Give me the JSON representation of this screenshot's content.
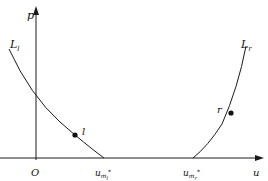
{
  "diagram": {
    "type": "p-u phase plane",
    "axes": {
      "x_label": "u",
      "y_label": "p",
      "origin_label": "O"
    },
    "curves": [
      {
        "id": "Ll",
        "label": "L",
        "label_sub": "l",
        "point_label": "l"
      },
      {
        "id": "Lr",
        "label": "L",
        "label_sub": "r",
        "point_label": "r"
      }
    ],
    "x_ticks": [
      {
        "label": "u",
        "sub": "m",
        "subsub": "l",
        "sup": "*"
      },
      {
        "label": "u",
        "sub": "m",
        "subsub": "r",
        "sup": "*"
      }
    ],
    "colors": {
      "line": "#1a1a1a",
      "text": "#111111",
      "background": "#ffffff"
    }
  }
}
